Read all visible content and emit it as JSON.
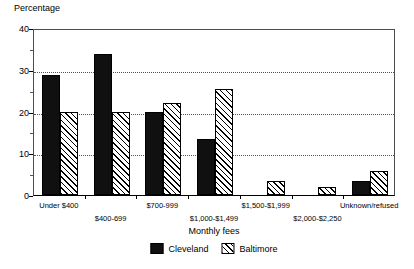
{
  "chart_data": {
    "type": "bar",
    "title": "",
    "subtitle": "",
    "xlabel": "Monthly fees",
    "ylabel": "Percentage",
    "ylim": [
      0,
      40
    ],
    "yticks": [
      0,
      10,
      20,
      30,
      40
    ],
    "ytick_labels": [
      "0",
      "10",
      "20",
      "30",
      "40"
    ],
    "yminor_ticks": [
      5,
      15,
      25,
      35
    ],
    "gridlines": [
      10,
      20,
      30
    ],
    "grid": true,
    "grid_style": "dotted",
    "legend_position": "bottom-center",
    "categories": [
      "Under $400",
      "$400-699",
      "$700-999",
      "$1,000-$1,499",
      "$1,500-$1,999",
      "$2,000-$2,250",
      "Unknown/refused"
    ],
    "series": [
      {
        "name": "Cleveland",
        "fill": "solid-black",
        "color": "#101010",
        "values": [
          28.8,
          33.7,
          20.0,
          13.5,
          0,
          0,
          3.3
        ]
      },
      {
        "name": "Baltimore",
        "fill": "diagonal-hatch",
        "color": "#ffffff",
        "values": [
          20.0,
          20.0,
          22.0,
          25.5,
          3.3,
          2.0,
          5.8
        ]
      }
    ]
  },
  "legend": {
    "entries": [
      {
        "label": "Cleveland"
      },
      {
        "label": "Baltimore"
      }
    ]
  },
  "axes": {
    "y_title": "Percentage",
    "x_title": "Monthly fees"
  }
}
